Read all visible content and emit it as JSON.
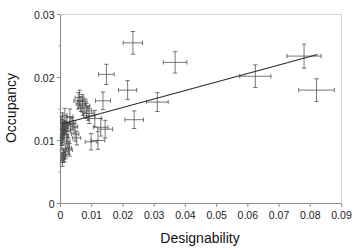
{
  "chart_data": {
    "type": "scatter",
    "title": "",
    "xlabel": "Designability",
    "ylabel": "Occupancy",
    "xlim": [
      0,
      0.09
    ],
    "ylim": [
      0,
      0.03
    ],
    "grid": false,
    "legend": "none",
    "xticks": [
      "0",
      "0.01",
      "0.02",
      "0.03",
      "0.04",
      "0.05",
      "0.06",
      "0.07",
      "0.08",
      "0.09"
    ],
    "xtick_values": [
      0,
      0.01,
      0.02,
      0.03,
      0.04,
      0.05,
      0.06,
      0.07,
      0.08,
      0.09
    ],
    "yticks": [
      "0",
      "0.01",
      "0.02",
      "0.03"
    ],
    "ytick_values": [
      0,
      0.01,
      0.02,
      0.03
    ],
    "marker": "plus-with-error-bars",
    "error_bars": "both-x-and-y",
    "points": [
      {
        "x": 0.0006,
        "y": 0.0068,
        "xerr": 0.0005,
        "yerr": 0.0009
      },
      {
        "x": 0.0008,
        "y": 0.0073,
        "xerr": 0.0005,
        "yerr": 0.0008
      },
      {
        "x": 0.001,
        "y": 0.0079,
        "xerr": 0.0006,
        "yerr": 0.0009
      },
      {
        "x": 0.0013,
        "y": 0.0076,
        "xerr": 0.0007,
        "yerr": 0.001
      },
      {
        "x": 0.0016,
        "y": 0.0082,
        "xerr": 0.0008,
        "yerr": 0.0011
      },
      {
        "x": 0.0004,
        "y": 0.0095,
        "xerr": 0.0004,
        "yerr": 0.001
      },
      {
        "x": 0.0005,
        "y": 0.0101,
        "xerr": 0.0004,
        "yerr": 0.0009
      },
      {
        "x": 0.0006,
        "y": 0.0106,
        "xerr": 0.0005,
        "yerr": 0.0009
      },
      {
        "x": 0.0007,
        "y": 0.011,
        "xerr": 0.0005,
        "yerr": 0.0008
      },
      {
        "x": 0.0008,
        "y": 0.0113,
        "xerr": 0.0005,
        "yerr": 0.0009
      },
      {
        "x": 0.0009,
        "y": 0.0117,
        "xerr": 0.0005,
        "yerr": 0.0008
      },
      {
        "x": 0.0011,
        "y": 0.012,
        "xerr": 0.0006,
        "yerr": 0.0009
      },
      {
        "x": 0.0013,
        "y": 0.0124,
        "xerr": 0.0006,
        "yerr": 0.0008
      },
      {
        "x": 0.0015,
        "y": 0.0118,
        "xerr": 0.0006,
        "yerr": 0.0009
      },
      {
        "x": 0.0018,
        "y": 0.0122,
        "xerr": 0.0007,
        "yerr": 0.0008
      },
      {
        "x": 0.0004,
        "y": 0.0128,
        "xerr": 0.0004,
        "yerr": 0.001
      },
      {
        "x": 0.0006,
        "y": 0.0133,
        "xerr": 0.0005,
        "yerr": 0.0011
      },
      {
        "x": 0.0021,
        "y": 0.0128,
        "xerr": 0.0008,
        "yerr": 0.0009
      },
      {
        "x": 0.0024,
        "y": 0.0115,
        "xerr": 0.0008,
        "yerr": 0.001
      },
      {
        "x": 0.0019,
        "y": 0.0105,
        "xerr": 0.0007,
        "yerr": 0.001
      },
      {
        "x": 0.0022,
        "y": 0.0099,
        "xerr": 0.0008,
        "yerr": 0.0011
      },
      {
        "x": 0.0026,
        "y": 0.0088,
        "xerr": 0.0009,
        "yerr": 0.001
      },
      {
        "x": 0.0029,
        "y": 0.0085,
        "xerr": 0.0009,
        "yerr": 0.001
      },
      {
        "x": 0.0014,
        "y": 0.014,
        "xerr": 0.0007,
        "yerr": 0.0011
      },
      {
        "x": 0.003,
        "y": 0.0138,
        "xerr": 0.001,
        "yerr": 0.0012
      },
      {
        "x": 0.0033,
        "y": 0.0126,
        "xerr": 0.001,
        "yerr": 0.001
      },
      {
        "x": 0.0038,
        "y": 0.0127,
        "xerr": 0.0011,
        "yerr": 0.0009
      },
      {
        "x": 0.0043,
        "y": 0.0122,
        "xerr": 0.0012,
        "yerr": 0.001
      },
      {
        "x": 0.0047,
        "y": 0.011,
        "xerr": 0.0012,
        "yerr": 0.0011
      },
      {
        "x": 0.0052,
        "y": 0.0104,
        "xerr": 0.0013,
        "yerr": 0.0011
      },
      {
        "x": 0.0057,
        "y": 0.0163,
        "xerr": 0.0014,
        "yerr": 0.0013
      },
      {
        "x": 0.0061,
        "y": 0.0168,
        "xerr": 0.0014,
        "yerr": 0.0012
      },
      {
        "x": 0.0065,
        "y": 0.0158,
        "xerr": 0.0015,
        "yerr": 0.0012
      },
      {
        "x": 0.007,
        "y": 0.0162,
        "xerr": 0.0015,
        "yerr": 0.0011
      },
      {
        "x": 0.0072,
        "y": 0.0152,
        "xerr": 0.0016,
        "yerr": 0.0012
      },
      {
        "x": 0.0078,
        "y": 0.0155,
        "xerr": 0.0016,
        "yerr": 0.0011
      },
      {
        "x": 0.0083,
        "y": 0.0147,
        "xerr": 0.0017,
        "yerr": 0.0012
      },
      {
        "x": 0.0088,
        "y": 0.0143,
        "xerr": 0.0017,
        "yerr": 0.0011
      },
      {
        "x": 0.0092,
        "y": 0.0139,
        "xerr": 0.0018,
        "yerr": 0.0012
      },
      {
        "x": 0.0098,
        "y": 0.0098,
        "xerr": 0.0019,
        "yerr": 0.0013
      },
      {
        "x": 0.011,
        "y": 0.0135,
        "xerr": 0.0021,
        "yerr": 0.0013
      },
      {
        "x": 0.012,
        "y": 0.01,
        "xerr": 0.0022,
        "yerr": 0.0014
      },
      {
        "x": 0.0129,
        "y": 0.0121,
        "xerr": 0.0023,
        "yerr": 0.0014
      },
      {
        "x": 0.0143,
        "y": 0.0118,
        "xerr": 0.0024,
        "yerr": 0.0014
      },
      {
        "x": 0.0136,
        "y": 0.0163,
        "xerr": 0.0024,
        "yerr": 0.0014
      },
      {
        "x": 0.0147,
        "y": 0.0205,
        "xerr": 0.0025,
        "yerr": 0.0016
      },
      {
        "x": 0.0232,
        "y": 0.0255,
        "xerr": 0.0031,
        "yerr": 0.0018
      },
      {
        "x": 0.0215,
        "y": 0.018,
        "xerr": 0.0029,
        "yerr": 0.0015
      },
      {
        "x": 0.0236,
        "y": 0.0133,
        "xerr": 0.003,
        "yerr": 0.0014
      },
      {
        "x": 0.031,
        "y": 0.0161,
        "xerr": 0.0035,
        "yerr": 0.0015
      },
      {
        "x": 0.0367,
        "y": 0.0224,
        "xerr": 0.0038,
        "yerr": 0.0017
      },
      {
        "x": 0.0624,
        "y": 0.0202,
        "xerr": 0.005,
        "yerr": 0.0018
      },
      {
        "x": 0.078,
        "y": 0.0234,
        "xerr": 0.0055,
        "yerr": 0.0019
      },
      {
        "x": 0.082,
        "y": 0.018,
        "xerr": 0.0057,
        "yerr": 0.0018
      }
    ],
    "trendline": {
      "x_start": 0.0005,
      "y_start": 0.01262,
      "x_end": 0.0823,
      "y_end": 0.02365
    }
  }
}
